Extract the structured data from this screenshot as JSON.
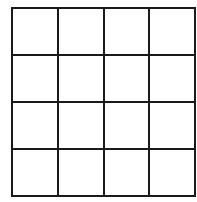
{
  "grid": {
    "rows": 4,
    "columns": 4,
    "line_color": "#1a1a1a",
    "background": "#ffffff",
    "cells": [
      [
        "",
        "",
        "",
        ""
      ],
      [
        "",
        "",
        "",
        ""
      ],
      [
        "",
        "",
        "",
        ""
      ],
      [
        "",
        "",
        "",
        ""
      ]
    ]
  }
}
